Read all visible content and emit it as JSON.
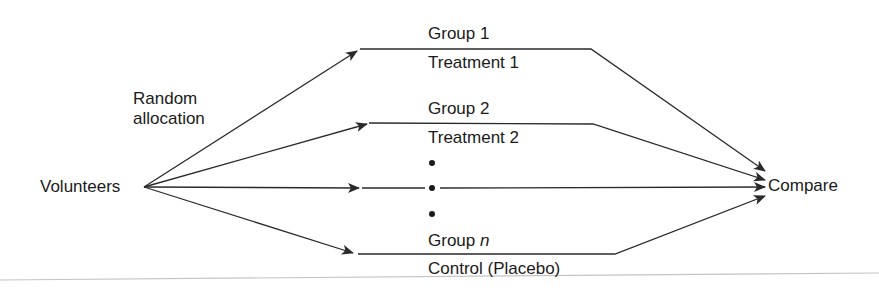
{
  "diagram": {
    "type": "flow",
    "source": {
      "label": "Volunteers"
    },
    "allocation_label": {
      "line1": "Random",
      "line2": "allocation"
    },
    "target": {
      "label": "Compare"
    },
    "groups": [
      {
        "group_label": "Group 1",
        "treatment_label": "Treatment 1"
      },
      {
        "group_label": "Group 2",
        "treatment_label": "Treatment 2"
      },
      {
        "group_label_prefix": "Group ",
        "group_label_var": "n",
        "treatment_label": "Control (Placebo)"
      }
    ],
    "ellipsis": "•",
    "colors": {
      "line": "#2a2a2a",
      "text": "#1a1a1a",
      "baseline": "#b8b8b8",
      "background": "#ffffff"
    }
  }
}
